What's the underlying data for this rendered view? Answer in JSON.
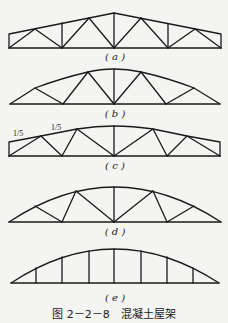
{
  "figure": {
    "caption": "图 2－2－8　混凝土屋架",
    "stroke_color": "#1a1a1a",
    "background": "#f4f4f2"
  },
  "trusses": [
    {
      "id": "a",
      "label": "( a )",
      "type": "trapezoidal truss with verticals and diagonals"
    },
    {
      "id": "b",
      "label": "( b )",
      "type": "curved top-chord triangular truss"
    },
    {
      "id": "c",
      "label": "( c )",
      "type": "low-slope trapezoidal truss",
      "slope_labels": [
        "1/5",
        "1/5"
      ]
    },
    {
      "id": "d",
      "label": "( d )",
      "type": "arched (segmental) truss with diagonals"
    },
    {
      "id": "e",
      "label": "( e )",
      "type": "arched truss with verticals only"
    }
  ]
}
